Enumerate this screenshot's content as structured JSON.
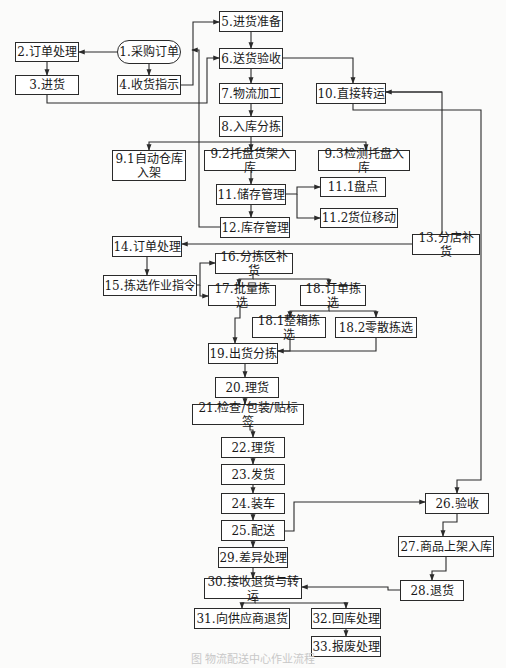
{
  "diagram": {
    "caption": "图 物流配送中心作业流程",
    "line_color": "#2a2a2a",
    "nodes": [
      {
        "id": "n1",
        "label": "1.采购订单",
        "x": 117,
        "y": 40,
        "w": 64,
        "h": 24,
        "shape": "pill"
      },
      {
        "id": "n2",
        "label": "2.订单处理",
        "x": 15,
        "y": 42,
        "w": 64,
        "h": 20
      },
      {
        "id": "n3",
        "label": "3.进货",
        "x": 15,
        "y": 75,
        "w": 64,
        "h": 20
      },
      {
        "id": "n4",
        "label": "4.收货指示",
        "x": 117,
        "y": 75,
        "w": 64,
        "h": 20
      },
      {
        "id": "n5",
        "label": "5.进货准备",
        "x": 219,
        "y": 11,
        "w": 64,
        "h": 21
      },
      {
        "id": "n6",
        "label": "6.送货验收",
        "x": 219,
        "y": 48,
        "w": 64,
        "h": 21
      },
      {
        "id": "n7",
        "label": "7.物流加工",
        "x": 219,
        "y": 83,
        "w": 64,
        "h": 21
      },
      {
        "id": "n8",
        "label": "8.入库分拣",
        "x": 219,
        "y": 116,
        "w": 64,
        "h": 21
      },
      {
        "id": "n10",
        "label": "10.直接转运",
        "x": 316,
        "y": 83,
        "w": 70,
        "h": 21
      },
      {
        "id": "n91",
        "label": "9.1自动仓库\n入架",
        "x": 112,
        "y": 150,
        "w": 74,
        "h": 31
      },
      {
        "id": "n92",
        "label": "9.2托盘货架入库",
        "x": 204,
        "y": 150,
        "w": 92,
        "h": 21
      },
      {
        "id": "n93",
        "label": "9.3检测托盘入库",
        "x": 318,
        "y": 150,
        "w": 92,
        "h": 21
      },
      {
        "id": "n11",
        "label": "11.储存管理",
        "x": 216,
        "y": 184,
        "w": 70,
        "h": 21
      },
      {
        "id": "n111",
        "label": "11.1盘点",
        "x": 320,
        "y": 177,
        "w": 66,
        "h": 20
      },
      {
        "id": "n112",
        "label": "11.2货位移动",
        "x": 320,
        "y": 208,
        "w": 78,
        "h": 20
      },
      {
        "id": "n12",
        "label": "12.库存管理",
        "x": 220,
        "y": 217,
        "w": 70,
        "h": 21
      },
      {
        "id": "n13",
        "label": "13.分店补货",
        "x": 412,
        "y": 234,
        "w": 68,
        "h": 21
      },
      {
        "id": "n14",
        "label": "14.订单处理",
        "x": 112,
        "y": 236,
        "w": 70,
        "h": 21
      },
      {
        "id": "n15",
        "label": "15.拣选作业指令",
        "x": 103,
        "y": 275,
        "w": 94,
        "h": 21
      },
      {
        "id": "n16",
        "label": "16.分拣区补货",
        "x": 215,
        "y": 253,
        "w": 78,
        "h": 21
      },
      {
        "id": "n17",
        "label": "17.批量拣选",
        "x": 208,
        "y": 285,
        "w": 68,
        "h": 21
      },
      {
        "id": "n18",
        "label": "18.订单拣选",
        "x": 300,
        "y": 285,
        "w": 66,
        "h": 21
      },
      {
        "id": "n181",
        "label": "18.1整箱拣选",
        "x": 252,
        "y": 317,
        "w": 74,
        "h": 21
      },
      {
        "id": "n182",
        "label": "18.2零散拣选",
        "x": 335,
        "y": 317,
        "w": 82,
        "h": 21
      },
      {
        "id": "n19",
        "label": "19.出货分拣",
        "x": 208,
        "y": 343,
        "w": 70,
        "h": 21
      },
      {
        "id": "n20",
        "label": "20.理货",
        "x": 215,
        "y": 377,
        "w": 64,
        "h": 21
      },
      {
        "id": "n21",
        "label": "21.检查/包装/贴标签",
        "x": 192,
        "y": 404,
        "w": 112,
        "h": 21
      },
      {
        "id": "n22",
        "label": "22.理货",
        "x": 221,
        "y": 437,
        "w": 64,
        "h": 21
      },
      {
        "id": "n23",
        "label": "23.发货",
        "x": 221,
        "y": 464,
        "w": 64,
        "h": 21
      },
      {
        "id": "n24",
        "label": "24.装车",
        "x": 221,
        "y": 493,
        "w": 64,
        "h": 21
      },
      {
        "id": "n25",
        "label": "25.配送",
        "x": 221,
        "y": 520,
        "w": 64,
        "h": 21
      },
      {
        "id": "n26",
        "label": "26.验收",
        "x": 425,
        "y": 493,
        "w": 64,
        "h": 21
      },
      {
        "id": "n27",
        "label": "27.商品上架入库",
        "x": 398,
        "y": 536,
        "w": 96,
        "h": 21
      },
      {
        "id": "n28",
        "label": "28.退货",
        "x": 400,
        "y": 580,
        "w": 64,
        "h": 21
      },
      {
        "id": "n29",
        "label": "29.差异处理",
        "x": 218,
        "y": 547,
        "w": 70,
        "h": 21
      },
      {
        "id": "n30",
        "label": "30.接收退货与转运",
        "x": 204,
        "y": 578,
        "w": 98,
        "h": 21
      },
      {
        "id": "n31",
        "label": "31.向供应商退货",
        "x": 194,
        "y": 608,
        "w": 96,
        "h": 21
      },
      {
        "id": "n32",
        "label": "32.回库处理",
        "x": 311,
        "y": 608,
        "w": 70,
        "h": 21
      },
      {
        "id": "n33",
        "label": "33.报废处理",
        "x": 311,
        "y": 636,
        "w": 70,
        "h": 21
      }
    ],
    "edges": [
      {
        "pts": [
          [
            117,
            52
          ],
          [
            79,
            52
          ]
        ],
        "arrow": true
      },
      {
        "pts": [
          [
            47,
            62
          ],
          [
            47,
            75
          ]
        ],
        "arrow": true
      },
      {
        "pts": [
          [
            149,
            64
          ],
          [
            149,
            75
          ]
        ],
        "arrow": true
      },
      {
        "pts": [
          [
            181,
            85
          ],
          [
            193,
            85
          ],
          [
            193,
            22
          ],
          [
            219,
            22
          ]
        ],
        "arrow": true
      },
      {
        "pts": [
          [
            47,
            95
          ],
          [
            47,
            103
          ],
          [
            207,
            103
          ],
          [
            207,
            58
          ],
          [
            219,
            58
          ]
        ],
        "arrow": true
      },
      {
        "pts": [
          [
            251,
            32
          ],
          [
            251,
            48
          ]
        ],
        "arrow": true
      },
      {
        "pts": [
          [
            251,
            69
          ],
          [
            251,
            83
          ]
        ],
        "arrow": true
      },
      {
        "pts": [
          [
            251,
            104
          ],
          [
            251,
            116
          ]
        ],
        "arrow": true
      },
      {
        "pts": [
          [
            283,
            58
          ],
          [
            353,
            58
          ],
          [
            353,
            83
          ]
        ],
        "arrow": true
      },
      {
        "pts": [
          [
            251,
            137
          ],
          [
            251,
            150
          ]
        ],
        "arrow": true
      },
      {
        "pts": [
          [
            251,
            142
          ],
          [
            149,
            142
          ],
          [
            149,
            150
          ]
        ],
        "arrow": true
      },
      {
        "pts": [
          [
            251,
            142
          ],
          [
            366,
            142
          ],
          [
            366,
            150
          ]
        ],
        "arrow": true
      },
      {
        "pts": [
          [
            251,
            171
          ],
          [
            251,
            184
          ]
        ],
        "arrow": true
      },
      {
        "pts": [
          [
            286,
            194
          ],
          [
            297,
            194
          ],
          [
            297,
            187
          ],
          [
            320,
            187
          ]
        ],
        "arrow": true
      },
      {
        "pts": [
          [
            297,
            194
          ],
          [
            297,
            218
          ],
          [
            320,
            218
          ]
        ],
        "arrow": true
      },
      {
        "pts": [
          [
            251,
            205
          ],
          [
            251,
            217
          ]
        ],
        "arrow": true
      },
      {
        "pts": [
          [
            220,
            227
          ],
          [
            199,
            227
          ],
          [
            199,
            50
          ],
          [
            192,
            50
          ]
        ],
        "arrow": true
      },
      {
        "pts": [
          [
            412,
            244
          ],
          [
            442,
            244
          ],
          [
            442,
            92
          ],
          [
            386,
            92
          ]
        ],
        "arrow": false
      },
      {
        "pts": [
          [
            442,
            92
          ],
          [
            386,
            92
          ]
        ],
        "arrow": true
      },
      {
        "pts": [
          [
            412,
            244
          ],
          [
            182,
            244
          ]
        ],
        "arrow": true
      },
      {
        "pts": [
          [
            353,
            104
          ],
          [
            353,
            110
          ],
          [
            481,
            110
          ],
          [
            481,
            480
          ],
          [
            457,
            480
          ],
          [
            457,
            493
          ]
        ],
        "arrow": true
      },
      {
        "pts": [
          [
            147,
            257
          ],
          [
            147,
            275
          ]
        ],
        "arrow": true
      },
      {
        "pts": [
          [
            197,
            285
          ],
          [
            200,
            285
          ],
          [
            200,
            263
          ],
          [
            215,
            263
          ]
        ],
        "arrow": true
      },
      {
        "pts": [
          [
            200,
            285
          ],
          [
            200,
            296
          ],
          [
            208,
            296
          ]
        ],
        "arrow": true
      },
      {
        "pts": [
          [
            253,
            274
          ],
          [
            253,
            279
          ],
          [
            239,
            279
          ],
          [
            239,
            285
          ]
        ],
        "arrow": true
      },
      {
        "pts": [
          [
            253,
            279
          ],
          [
            329,
            279
          ],
          [
            329,
            285
          ]
        ],
        "arrow": true
      },
      {
        "pts": [
          [
            329,
            306
          ],
          [
            329,
            311
          ],
          [
            290,
            311
          ],
          [
            290,
            317
          ]
        ],
        "arrow": true
      },
      {
        "pts": [
          [
            329,
            311
          ],
          [
            376,
            311
          ],
          [
            376,
            317
          ]
        ],
        "arrow": true
      },
      {
        "pts": [
          [
            240,
            306
          ],
          [
            240,
            318
          ],
          [
            235,
            318
          ],
          [
            235,
            343
          ]
        ],
        "arrow": true
      },
      {
        "pts": [
          [
            290,
            338
          ],
          [
            290,
            351
          ],
          [
            278,
            351
          ]
        ],
        "arrow": false
      },
      {
        "pts": [
          [
            376,
            338
          ],
          [
            376,
            351
          ],
          [
            278,
            351
          ]
        ],
        "arrow": true
      },
      {
        "pts": [
          [
            245,
            364
          ],
          [
            245,
            377
          ]
        ],
        "arrow": true
      },
      {
        "pts": [
          [
            245,
            398
          ],
          [
            245,
            404
          ]
        ],
        "arrow": true
      },
      {
        "pts": [
          [
            250,
            425
          ],
          [
            250,
            430
          ],
          [
            253,
            430
          ],
          [
            253,
            437
          ]
        ],
        "arrow": true
      },
      {
        "pts": [
          [
            253,
            458
          ],
          [
            253,
            464
          ]
        ],
        "arrow": true
      },
      {
        "pts": [
          [
            253,
            485
          ],
          [
            253,
            493
          ]
        ],
        "arrow": true
      },
      {
        "pts": [
          [
            253,
            514
          ],
          [
            253,
            520
          ]
        ],
        "arrow": true
      },
      {
        "pts": [
          [
            285,
            531
          ],
          [
            294,
            531
          ],
          [
            294,
            502
          ],
          [
            425,
            502
          ]
        ],
        "arrow": true
      },
      {
        "pts": [
          [
            253,
            541
          ],
          [
            253,
            547
          ]
        ],
        "arrow": true
      },
      {
        "pts": [
          [
            457,
            514
          ],
          [
            457,
            522
          ],
          [
            443,
            522
          ],
          [
            443,
            536
          ]
        ],
        "arrow": true
      },
      {
        "pts": [
          [
            446,
            557
          ],
          [
            446,
            571
          ],
          [
            432,
            571
          ],
          [
            432,
            580
          ]
        ],
        "arrow": true
      },
      {
        "pts": [
          [
            400,
            590
          ],
          [
            388,
            590
          ],
          [
            388,
            587
          ],
          [
            302,
            587
          ]
        ],
        "arrow": true
      },
      {
        "pts": [
          [
            253,
            568
          ],
          [
            253,
            578
          ]
        ],
        "arrow": true
      },
      {
        "pts": [
          [
            255,
            599
          ],
          [
            255,
            603
          ],
          [
            242,
            603
          ],
          [
            242,
            608
          ]
        ],
        "arrow": true
      },
      {
        "pts": [
          [
            255,
            603
          ],
          [
            346,
            603
          ],
          [
            346,
            608
          ]
        ],
        "arrow": true
      },
      {
        "pts": [
          [
            346,
            629
          ],
          [
            346,
            636
          ]
        ],
        "arrow": true
      }
    ]
  }
}
